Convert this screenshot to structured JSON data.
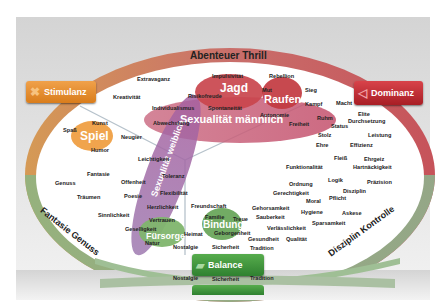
{
  "colors": {
    "background": "#dcdcdc",
    "ring": "#9fb4c4",
    "inner": "#ffffff",
    "stimulanz": "#e8902a",
    "dominanz": "#c0272d",
    "balance": "#3e9a3a",
    "sexualitaet_maennlich": "#c44a6e",
    "sexualitaet_weiblich": "#9a5aa0",
    "divider": "#b7c3cc"
  },
  "ring_labels": {
    "top": "Abenteuer Thrill",
    "left": "Fantasie Genuss",
    "right": "Disziplin Kontrolle"
  },
  "buttons": {
    "stimulanz": "Stimulanz",
    "dominanz": "Dominanz",
    "balance": "Balance"
  },
  "modules": {
    "jagd": "Jagd",
    "raufen": "Raufen",
    "spiel": "Spiel",
    "fuersorge": "Fürsorge",
    "bindung": "Bindung",
    "sex_m": "Sexualität männlich",
    "sex_w": "Sexualität weiblich"
  },
  "words": {
    "extravaganz": "Extravaganz",
    "impulsivitaet": "Impulsivität",
    "rebellion": "Rebellion",
    "kreativitaet": "Kreativität",
    "risikofreude": "Risikofreude",
    "mut": "Mut",
    "sieg": "Sieg",
    "individualismus": "Individualismus",
    "spontaneitaet": "Spontaneität",
    "kampf": "Kampf",
    "macht": "Macht",
    "autonomie": "Autonomie",
    "abwechslung": "Abwechslung",
    "freiheit": "Freiheit",
    "ruhm": "Ruhm",
    "elite": "Elite",
    "status": "Status",
    "durchsetzung": "Durchsetzung",
    "kunst": "Kunst",
    "spass": "Spaß",
    "neugier": "Neugier",
    "humor": "Humor",
    "stolz": "Stolz",
    "leistung": "Leistung",
    "ehre": "Ehre",
    "effizienz": "Effizienz",
    "leichtigkeit": "Leichtigkeit",
    "fleiss": "Fleiß",
    "ehrgeiz": "Ehrgeiz",
    "funktionalitaet": "Funktionalität",
    "hartnaeckigkeit": "Hartnäckigkeit",
    "fantasie": "Fantasie",
    "toleranz": "Toleranz",
    "genuss": "Genuss",
    "offenheit": "Offenheit",
    "logik": "Logik",
    "praezision": "Präzision",
    "ordnung": "Ordnung",
    "traeumen": "Träumen",
    "poesie": "Poesie",
    "flexibilitaet": "Flexibilität",
    "gerechtigkeit": "Gerechtigkeit",
    "disziplin": "Disziplin",
    "moral": "Moral",
    "pflicht": "Pflicht",
    "herzlichkeit": "Herzlichkeit",
    "freundschaft": "Freundschaft",
    "sinnlichkeit": "Sinnlichkeit",
    "gehorsamkeit": "Gehorsamkeit",
    "hygiene": "Hygiene",
    "askese": "Askese",
    "vertrauen": "Vertrauen",
    "familie": "Familie",
    "treue": "Treue",
    "sauberkeit": "Sauberkeit",
    "geselligkeit": "Geselligkeit",
    "sparsamkeit": "Sparsamkeit",
    "verlaesslichkeit": "Verlässlichkeit",
    "heimat": "Heimat",
    "geborgenheit": "Geborgenheit",
    "natur": "Natur",
    "gesundheit": "Gesundheit",
    "qualitaet": "Qualität",
    "nostalgie": "Nostalgie",
    "sicherheit": "Sicherheit",
    "tradition": "Tradition",
    "nostalgie2": "Nostalgie",
    "sicherheit2": "Sicherheit",
    "tradition2": "Tradition"
  }
}
